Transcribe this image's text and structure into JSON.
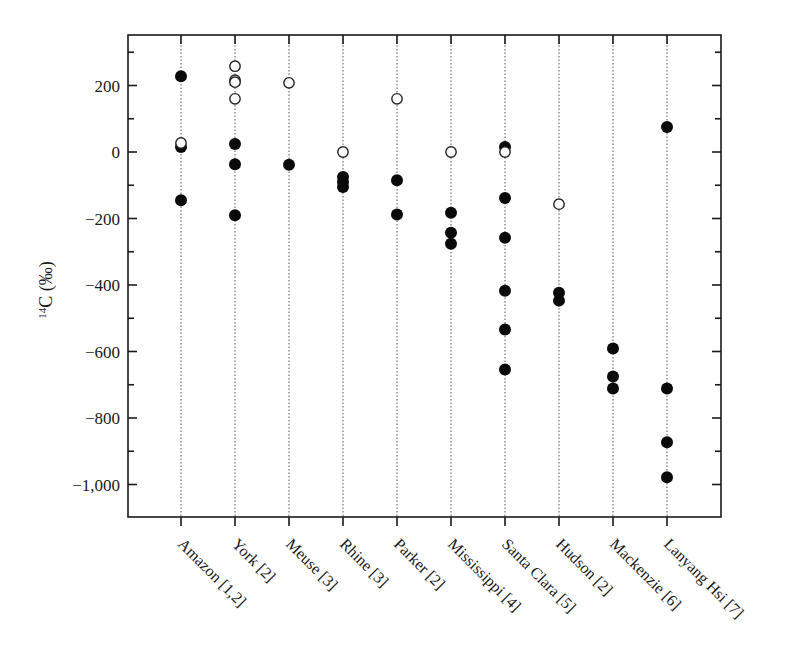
{
  "chart_data": {
    "type": "scatter",
    "title": "",
    "xlabel": "",
    "ylabel": "14C (‰)",
    "ylabel_sup": "14",
    "ylabel_main": "C (‰)",
    "ylim": [
      -1100,
      340
    ],
    "yticks": [
      200,
      0,
      -200,
      -400,
      -600,
      -800,
      -1000
    ],
    "ytick_labels": [
      "200",
      "0",
      "−200",
      "−400",
      "−600",
      "−800",
      "−1,000"
    ],
    "grid": "vertical dotted lines at each category",
    "legend": "none",
    "categories": [
      "Amazon [1,2]",
      "York [2]",
      "Meuse [3]",
      "Rhine [3]",
      "Parker [2]",
      "Mississippi [4]",
      "Santa Clara [5]",
      "Hudson [2]",
      "Mackenzie [6]",
      "Lanyang Hsi [7]"
    ],
    "series": [
      {
        "name": "filled",
        "marker": "filled-circle",
        "color": "#000000",
        "values": [
          [
            228,
            15,
            -145
          ],
          [
            24,
            -37,
            -190
          ],
          [
            -38
          ],
          [
            -75,
            -90,
            -105
          ],
          [
            -85,
            -188
          ],
          [
            -183,
            -243,
            -276
          ],
          [
            15,
            -138,
            -258,
            -417,
            -534,
            -654
          ],
          [
            -423,
            -447
          ],
          [
            -591,
            -675,
            -711
          ],
          [
            75,
            -711,
            -873,
            -978
          ]
        ]
      },
      {
        "name": "open",
        "marker": "open-circle",
        "color": "#000000",
        "values": [
          [
            27
          ],
          [
            258,
            216,
            210,
            160
          ],
          [
            208
          ],
          [
            0
          ],
          [
            160
          ],
          [
            0
          ],
          [
            0
          ],
          [
            -157
          ],
          [],
          []
        ]
      }
    ]
  }
}
